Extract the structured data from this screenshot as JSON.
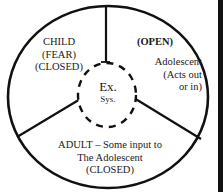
{
  "diagram": {
    "type": "segmented-circle",
    "segments": {
      "child": {
        "lines": [
          "CHILD",
          "(FEAR)",
          "(CLOSED)"
        ]
      },
      "open": {
        "heading": "(OPEN)",
        "lines": [
          "Adolescent",
          "(Acts out",
          "or in)"
        ]
      },
      "adult": {
        "lines": [
          "ADULT – Some input to",
          "The Adolescent",
          "(CLOSED)"
        ]
      }
    },
    "center": {
      "line1": "Ex.",
      "line2": "Sys.",
      "border_style": "dashed"
    },
    "colors": {
      "stroke": "#111111",
      "background": "#ffffff",
      "text": "#1a1a1a"
    }
  }
}
